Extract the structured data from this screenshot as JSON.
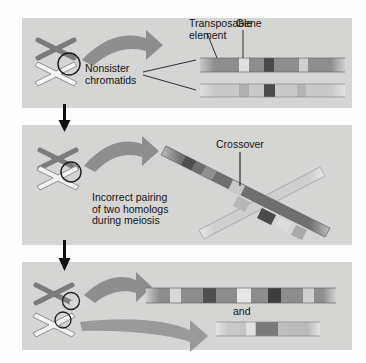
{
  "figure": {
    "background_color": "#d5d5d4",
    "page_color": "#fefefe"
  },
  "panels": [
    {
      "id": "panel-1",
      "labels": {
        "transposable_element": "Transposable\nelement",
        "gene": "Gene",
        "nonsister_chromatids": "Nonsister\nchromatids"
      },
      "chromosomes": [
        {
          "name": "dark-homolog",
          "style": "filled",
          "color": "#7b7b7b"
        },
        {
          "name": "light-homolog",
          "style": "outlined",
          "color": "#f2f2f2"
        }
      ],
      "chromatids": [
        {
          "name": "upper-chromatid",
          "base_color": "#8d8d8d",
          "bands": [
            {
              "type": "transposable-element",
              "position_pct": 27,
              "width_pct": 7,
              "color": "#d8d8d8"
            },
            {
              "type": "gene",
              "position_pct": 45,
              "width_pct": 7,
              "color": "#4a4a4a"
            },
            {
              "type": "transposable-element",
              "position_pct": 68,
              "width_pct": 6,
              "color": "#d0d0d0"
            }
          ]
        },
        {
          "name": "lower-chromatid",
          "base_color": "#c9c9c9",
          "bands": [
            {
              "type": "transposable-element",
              "position_pct": 27,
              "width_pct": 7,
              "color": "#b0b0b0"
            },
            {
              "type": "gene",
              "position_pct": 45,
              "width_pct": 8,
              "color": "#4a4a4a"
            },
            {
              "type": "transposable-element",
              "position_pct": 66,
              "width_pct": 6,
              "color": "#b4b4b4"
            }
          ]
        }
      ]
    },
    {
      "id": "panel-2",
      "labels": {
        "crossover": "Crossover",
        "incorrect_pairing": "Incorrect pairing\nof two homologs\nduring meiosis"
      },
      "chromatids": [
        {
          "name": "dark-diagonal-chromatid",
          "orientation": "upper-left-to-lower-right",
          "base_color": "#6f6f6f"
        },
        {
          "name": "light-diagonal-chromatid",
          "orientation": "lower-left-to-upper-right",
          "base_color": "#d2d2d2"
        }
      ]
    },
    {
      "id": "panel-3",
      "labels": {
        "and": "and"
      },
      "chromosomes": [
        {
          "name": "duplication-chromosome",
          "style": "filled",
          "color": "#7b7b7b"
        },
        {
          "name": "deletion-chromosome",
          "style": "outlined",
          "color": "#f2f2f2"
        }
      ],
      "products": [
        {
          "name": "duplication-product",
          "base_color": "#8d8d8d",
          "description": "chromatid with duplicated segment",
          "bands": [
            {
              "type": "transposable-element",
              "position_pct": 14,
              "width_pct": 6,
              "color": "#d8d8d8"
            },
            {
              "type": "gene",
              "position_pct": 31,
              "width_pct": 7,
              "color": "#4f4f4f"
            },
            {
              "type": "transposable-element",
              "position_pct": 50,
              "width_pct": 7,
              "color": "#e2e2e2"
            },
            {
              "type": "gene",
              "position_pct": 64,
              "width_pct": 7,
              "color": "#3d3d3d"
            },
            {
              "type": "transposable-element",
              "position_pct": 82,
              "width_pct": 6,
              "color": "#cfcfcf"
            }
          ]
        },
        {
          "name": "deletion-product",
          "base_color": "#c9c9c9",
          "description": "chromatid with deleted segment",
          "bands": [
            {
              "type": "transposable-element",
              "position_pct": 30,
              "width_pct": 10,
              "color": "#dedede"
            },
            {
              "type": "gene",
              "position_pct": 48,
              "width_pct": 20,
              "color": "#7a7a7a"
            }
          ]
        }
      ]
    }
  ],
  "connectors": [
    {
      "name": "arrow-panel1-to-panel2",
      "type": "black-down-arrow"
    },
    {
      "name": "arrow-panel2-to-panel3",
      "type": "black-down-arrow"
    }
  ]
}
